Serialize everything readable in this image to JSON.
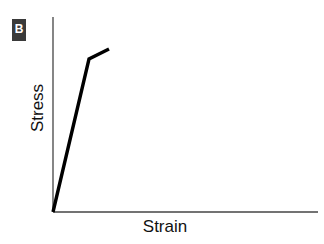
{
  "panel": {
    "label": "B"
  },
  "chart_data": {
    "type": "line",
    "title": "",
    "xlabel": "Strain",
    "ylabel": "Stress",
    "grid": false,
    "legend": null,
    "ticks": false,
    "series": [
      {
        "name": "stress-strain",
        "description": "Linear elastic region rising steeply, then a knee (yield point) with a shallow plastic slope",
        "points_px": [
          [
            53,
            212
          ],
          [
            89,
            59
          ],
          [
            109,
            49
          ]
        ],
        "points_normalized": [
          [
            0.0,
            0.0
          ],
          [
            0.136,
            0.785
          ],
          [
            0.211,
            0.836
          ]
        ]
      }
    ],
    "axes": {
      "origin_px": [
        53,
        212
      ],
      "x_end_px": [
        318,
        212
      ],
      "y_end_px": [
        53,
        17
      ]
    }
  }
}
